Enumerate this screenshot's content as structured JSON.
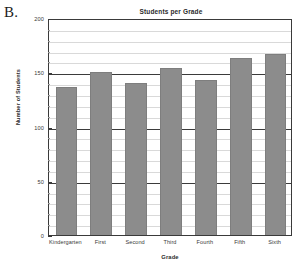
{
  "figure": {
    "label": "B."
  },
  "chart_data": {
    "type": "bar",
    "title": "Students per Grade",
    "xlabel": "Grade",
    "ylabel": "Number of Students",
    "categories": [
      "Kindergarten",
      "First",
      "Second",
      "Third",
      "Fourth",
      "Fifth",
      "Sixth"
    ],
    "values": [
      136,
      150,
      140,
      154,
      143,
      163,
      167
    ],
    "ylim": [
      0,
      200
    ],
    "ytick_labels": [
      "0",
      "50",
      "100",
      "150",
      "200"
    ],
    "ytick_values": [
      0,
      50,
      100,
      150,
      200
    ],
    "minor_tick_interval": 10,
    "grid": true,
    "legend": false,
    "bar_color": "#8c8c8c",
    "grid_color_minor": "#d9d9d9",
    "grid_color_major": "#3b3b3b",
    "axis_color": "#3a3a3a"
  }
}
